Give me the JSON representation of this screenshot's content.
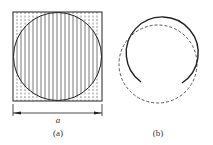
{
  "figure": {
    "panels": [
      {
        "id": "a",
        "caption": "(a)",
        "dimension_label": "a",
        "description": "Square of side a with inscribed circle, filled with vertical hatching lines (solid inside circle, dashed in corners)"
      },
      {
        "id": "b",
        "caption": "(b)",
        "description": "Solid open circular arc (gap at bottom) with a dashed circle offset slightly downward"
      }
    ],
    "colors": {
      "line": "#222222",
      "hatch": "#555555",
      "background": "#ffffff"
    }
  }
}
